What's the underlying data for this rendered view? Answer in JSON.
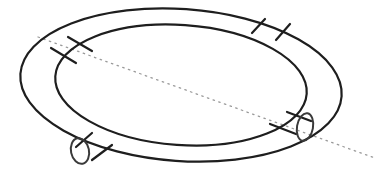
{
  "figure": {
    "width": 375,
    "height": 177,
    "background": "#ffffff",
    "colors": {
      "line": "#1e1e1e",
      "ring": "#3a3a3a",
      "axis": "#9a9a9a"
    },
    "outer_ellipse": {
      "cx": 181,
      "cy": 85,
      "rx": 161,
      "ry": 76,
      "rotate": 4
    },
    "inner_ellipse": {
      "cx": 181,
      "cy": 85,
      "rx": 126,
      "ry": 60,
      "rotate": 4
    },
    "axis_line": {
      "x1": 38,
      "y1": 37,
      "x2": 375,
      "y2": 158
    },
    "crossbars": [
      {
        "name": "upper-left",
        "lines": [
          [
            68,
            37,
            92,
            51
          ],
          [
            51,
            48,
            76,
            63
          ]
        ]
      },
      {
        "name": "upper-right",
        "lines": [
          [
            265,
            19,
            252,
            33
          ],
          [
            290,
            24,
            276,
            40
          ]
        ]
      },
      {
        "name": "lower-left",
        "lines": [
          [
            92,
            133,
            76,
            147
          ],
          [
            112,
            145,
            92,
            160
          ]
        ]
      },
      {
        "name": "lower-right",
        "lines": [
          [
            287,
            112,
            311,
            121
          ],
          [
            270,
            124,
            296,
            134
          ]
        ]
      }
    ],
    "rings": [
      {
        "name": "lower-left-ring",
        "cx": 80,
        "cy": 151,
        "rx": 9,
        "ry": 13,
        "rotate": -12
      },
      {
        "name": "lower-right-ring",
        "cx": 305,
        "cy": 127,
        "rx": 8,
        "ry": 14,
        "rotate": 10
      }
    ]
  }
}
